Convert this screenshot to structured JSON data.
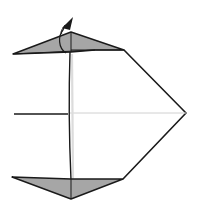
{
  "diagram": {
    "type": "origami-folding-step",
    "colors": {
      "background": "#ffffff",
      "line": "#1a1a1a",
      "flap_fill": "#a6a6a6",
      "crease_light": "#d0d0d0"
    },
    "elements": [
      {
        "name": "top-flap",
        "description": "gray triangular flap at top"
      },
      {
        "name": "bottom-flap",
        "description": "gray triangular flap at bottom"
      },
      {
        "name": "center-crease",
        "description": "horizontal center line"
      },
      {
        "name": "fold-arrow",
        "description": "curved arrow indicating fold up behind"
      }
    ]
  }
}
